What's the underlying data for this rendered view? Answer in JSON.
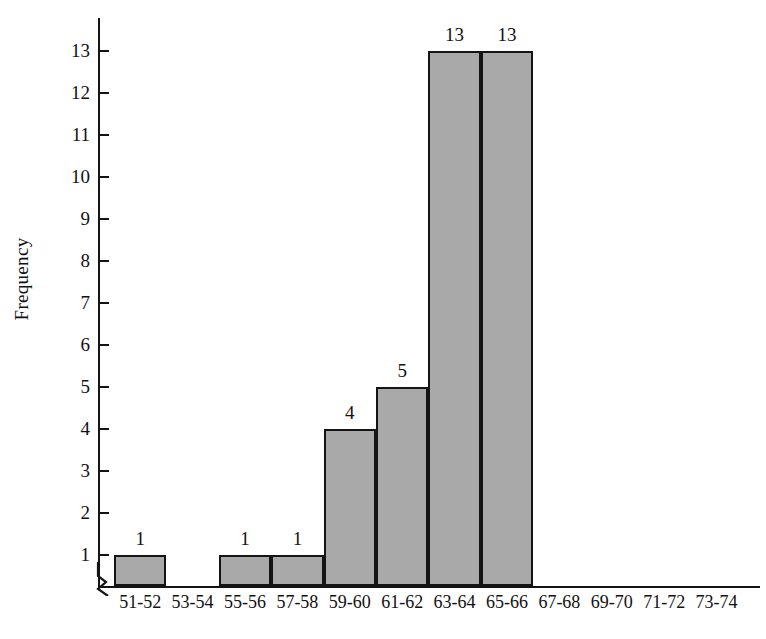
{
  "chart_data": {
    "type": "bar",
    "title": "",
    "subtitle": "",
    "xlabel": "",
    "ylabel": "Frequency",
    "categories": [
      "51-52",
      "53-54",
      "55-56",
      "57-58",
      "59-60",
      "61-62",
      "63-64",
      "65-66",
      "67-68",
      "69-70",
      "71-72",
      "73-74"
    ],
    "values": [
      1,
      0,
      1,
      1,
      4,
      5,
      13,
      13,
      0,
      0,
      0,
      0
    ],
    "bar_labels": [
      "1",
      "",
      "1",
      "1",
      "4",
      "5",
      "13",
      "13",
      "",
      "",
      "",
      ""
    ],
    "ylim": [
      0,
      13
    ],
    "y_ticks": [
      1,
      2,
      3,
      4,
      5,
      6,
      7,
      8,
      9,
      10,
      11,
      12,
      13
    ],
    "y_tick_labels": [
      "1",
      "2",
      "3",
      "4",
      "5",
      "6",
      "7",
      "8",
      "9",
      "10",
      "11",
      "12",
      "13"
    ],
    "grid": false,
    "legend": false,
    "legend_position": "none",
    "axis_break": true,
    "annotations": []
  },
  "style": {
    "bar_fill": "#a9a9a9",
    "bar_stroke": "#141414",
    "axis_color": "#141414",
    "text_color": "#111111",
    "background": "#ffffff"
  }
}
